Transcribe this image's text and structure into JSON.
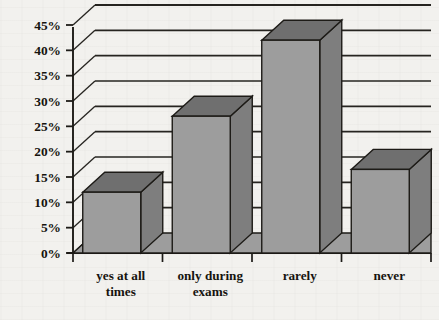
{
  "chart_data": {
    "type": "bar",
    "title": "",
    "subtitle": "",
    "xlabel": "",
    "ylabel": "",
    "categories": [
      "yes at all times",
      "only during exams",
      "rarely",
      "never"
    ],
    "values": [
      12,
      27,
      42,
      16.5
    ],
    "value_labels": [
      "12%",
      "27%",
      "42%",
      "16.5%"
    ],
    "ylim": [
      0,
      45
    ],
    "ytick_step": 5,
    "ytick_labels": [
      "0%",
      "5%",
      "10%",
      "15%",
      "20%",
      "25%",
      "30%",
      "35%",
      "40%",
      "45%"
    ],
    "ytick_values": [
      0,
      5,
      10,
      15,
      20,
      25,
      30,
      35,
      40,
      45
    ],
    "grid": true,
    "grid_axis": "y",
    "legend": false,
    "legend_position": "none",
    "style": "3d-column",
    "colors": {
      "bar_front": "#9d9d9d",
      "bar_side": "#7e7e7e",
      "bar_top": "#6f6f6f",
      "floor": "#9d9d9d",
      "outline": "#1d1b17",
      "grid_line": "#262420",
      "background": "#f2f1ee",
      "text": "#16140f"
    }
  },
  "category_label_lines": [
    [
      "yes at all",
      "times"
    ],
    [
      "only during",
      "exams"
    ],
    [
      "rarely",
      ""
    ],
    [
      "never",
      ""
    ]
  ]
}
